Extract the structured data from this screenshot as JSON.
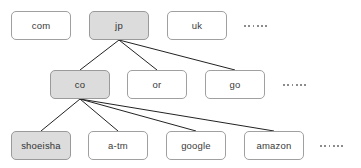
{
  "diagram": {
    "type": "tree",
    "colors": {
      "node_fill_default": "#ffffff",
      "node_fill_highlight": "#dcdcdc",
      "node_border": "#a0a0a0",
      "edge": "#222222",
      "text": "#3a3a3a",
      "background": "#ffffff"
    },
    "levels": [
      {
        "name": "top-level-domains",
        "nodes": [
          {
            "id": "com",
            "label": "com",
            "highlighted": false,
            "x": 11,
            "y": 11,
            "w": 60,
            "h": 29
          },
          {
            "id": "jp",
            "label": "jp",
            "highlighted": true,
            "x": 89,
            "y": 11,
            "w": 60,
            "h": 29
          },
          {
            "id": "uk",
            "label": "uk",
            "highlighted": false,
            "x": 167,
            "y": 11,
            "w": 60,
            "h": 29
          }
        ],
        "ellipsis": {
          "id": "tld-ellipsis",
          "x": 244,
          "y": 22,
          "dots": 6
        }
      },
      {
        "name": "second-level-domains",
        "nodes": [
          {
            "id": "co",
            "label": "co",
            "highlighted": true,
            "x": 50,
            "y": 70,
            "w": 60,
            "h": 29
          },
          {
            "id": "or",
            "label": "or",
            "highlighted": false,
            "x": 127,
            "y": 70,
            "w": 60,
            "h": 29
          },
          {
            "id": "go",
            "label": "go",
            "highlighted": false,
            "x": 205,
            "y": 70,
            "w": 60,
            "h": 29
          }
        ],
        "ellipsis": {
          "id": "sld-ellipsis",
          "x": 283,
          "y": 81,
          "dots": 6
        }
      },
      {
        "name": "organization-domains",
        "nodes": [
          {
            "id": "shoeisha",
            "label": "shoeisha",
            "highlighted": true,
            "x": 11,
            "y": 131,
            "w": 60,
            "h": 29
          },
          {
            "id": "a-tm",
            "label": "a-tm",
            "highlighted": false,
            "x": 88,
            "y": 131,
            "w": 60,
            "h": 29
          },
          {
            "id": "google",
            "label": "google",
            "highlighted": false,
            "x": 166,
            "y": 131,
            "w": 60,
            "h": 29
          },
          {
            "id": "amazon",
            "label": "amazon",
            "highlighted": false,
            "x": 244,
            "y": 131,
            "w": 60,
            "h": 29
          }
        ],
        "ellipsis": {
          "id": "org-ellipsis",
          "x": 320,
          "y": 142,
          "dots": 6
        }
      }
    ],
    "edges": [
      {
        "id": "jp-co",
        "from": "jp",
        "to": "co",
        "x1": 119,
        "y1": 40,
        "x2": 80,
        "y2": 70
      },
      {
        "id": "jp-or",
        "from": "jp",
        "to": "or",
        "x1": 119,
        "y1": 40,
        "x2": 157,
        "y2": 70
      },
      {
        "id": "jp-go",
        "from": "jp",
        "to": "go",
        "x1": 119,
        "y1": 40,
        "x2": 235,
        "y2": 70
      },
      {
        "id": "co-shoeisha",
        "from": "co",
        "to": "shoeisha",
        "x1": 80,
        "y1": 99,
        "x2": 41,
        "y2": 131
      },
      {
        "id": "co-a-tm",
        "from": "co",
        "to": "a-tm",
        "x1": 80,
        "y1": 99,
        "x2": 118,
        "y2": 131
      },
      {
        "id": "co-google",
        "from": "co",
        "to": "google",
        "x1": 80,
        "y1": 99,
        "x2": 196,
        "y2": 131
      },
      {
        "id": "co-amazon",
        "from": "co",
        "to": "amazon",
        "x1": 80,
        "y1": 99,
        "x2": 274,
        "y2": 131
      }
    ]
  }
}
